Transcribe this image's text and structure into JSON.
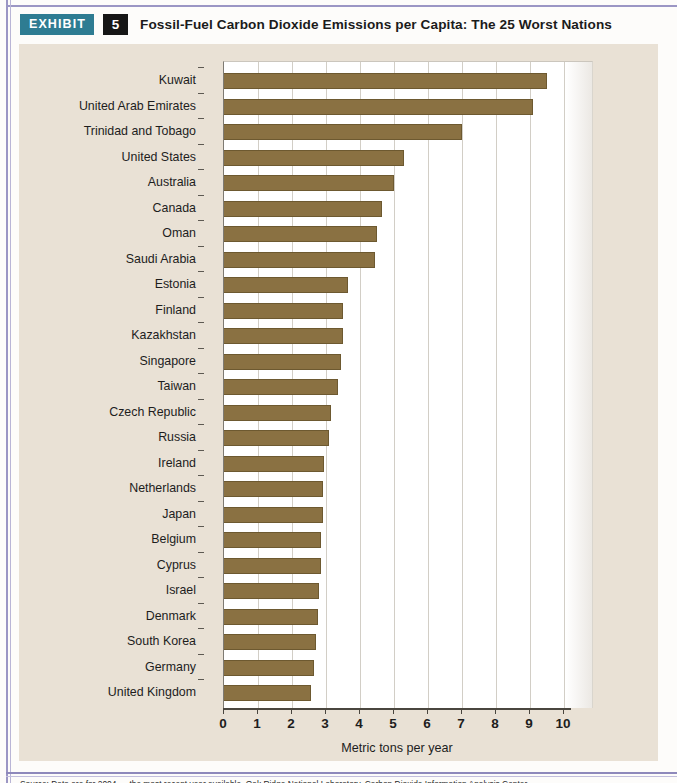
{
  "header": {
    "badge_label": "EXHIBIT",
    "exhibit_number": "5",
    "title": "Fossil-Fuel Carbon Dioxide Emissions per Capita: The 25 Worst Nations"
  },
  "colors": {
    "bar_fill": "#8a7142",
    "bar_stroke": "#6d5930",
    "panel_background": "#e9e1d5",
    "plot_background": "#ffffff",
    "badge_exhibit": "#2e7c92",
    "badge_number": "#161616",
    "page_rule": "#9b96c4",
    "gridline": "#d2cec6",
    "axis": "#4a463f"
  },
  "chart_data": {
    "type": "bar",
    "orientation": "horizontal",
    "title": "Fossil-Fuel Carbon Dioxide Emissions per Capita: The 25 Worst Nations",
    "xlabel": "Metric tons per year",
    "ylabel": "",
    "xlim": [
      0,
      10.3
    ],
    "xticks": [
      0,
      1,
      2,
      3,
      4,
      5,
      6,
      7,
      8,
      9,
      10
    ],
    "xticklabels": [
      "0",
      "1",
      "2",
      "3",
      "4",
      "5",
      "6",
      "7",
      "8",
      "9",
      "10"
    ],
    "grid": "vertical",
    "legend": "none",
    "categories": [
      "Kuwait",
      "United Arab Emirates",
      "Trinidad and Tobago",
      "United States",
      "Australia",
      "Canada",
      "Oman",
      "Saudi Arabia",
      "Estonia",
      "Finland",
      "Kazakhstan",
      "Singapore",
      "Taiwan",
      "Czech Republic",
      "Russia",
      "Ireland",
      "Netherlands",
      "Japan",
      "Belgium",
      "Cyprus",
      "Israel",
      "Denmark",
      "South Korea",
      "Germany",
      "United Kingdom"
    ],
    "values": [
      9.5,
      9.1,
      7.0,
      5.3,
      5.0,
      4.65,
      4.5,
      4.45,
      3.65,
      3.5,
      3.5,
      3.45,
      3.35,
      3.15,
      3.1,
      2.95,
      2.9,
      2.9,
      2.85,
      2.85,
      2.8,
      2.75,
      2.7,
      2.65,
      2.55
    ]
  },
  "source": {
    "text": "Source: Data are for 2004 — the most recent year available. Oak Ridge National Laboratory, Carbon Dioxide Information Analysis Center."
  }
}
